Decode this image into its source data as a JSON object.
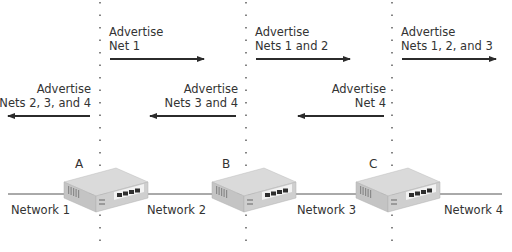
{
  "diagram": {
    "type": "distance-vector-routing-advertisement",
    "routers": [
      {
        "label": "A"
      },
      {
        "label": "B"
      },
      {
        "label": "C"
      }
    ],
    "networks": [
      {
        "label": "Network 1"
      },
      {
        "label": "Network 2"
      },
      {
        "label": "Network 3"
      },
      {
        "label": "Network 4"
      }
    ],
    "advertisements_right": [
      {
        "line1": "Advertise",
        "line2": "Net 1"
      },
      {
        "line1": "Advertise",
        "line2": "Nets 1 and 2"
      },
      {
        "line1": "Advertise",
        "line2": "Nets 1, 2, and 3"
      }
    ],
    "advertisements_left": [
      {
        "line1": "Advertise",
        "line2": "Nets 2, 3, and 4"
      },
      {
        "line1": "Advertise",
        "line2": "Nets 3 and 4"
      },
      {
        "line1": "Advertise",
        "line2": "Net 4"
      }
    ],
    "colors": {
      "text": "#333333",
      "arrow": "#2b2b2b",
      "line": "#555555",
      "router_top": "#d6d6d6",
      "router_front": "#c2c2c2",
      "router_side": "#b5b5b5"
    }
  }
}
